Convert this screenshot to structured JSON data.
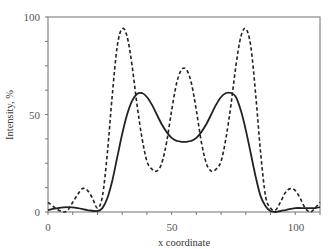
{
  "chart_data": {
    "type": "line",
    "title": "",
    "xlabel": "x coordinate",
    "ylabel": "Intensity, %",
    "xlim": [
      0,
      110
    ],
    "ylim": [
      0,
      100
    ],
    "x_ticks": [
      0,
      50,
      100
    ],
    "y_ticks": [
      0,
      50,
      100
    ],
    "x_minor_step": 10,
    "y_minor_step": 12.5,
    "grid": false,
    "legend": null,
    "series": [
      {
        "name": "dashed",
        "style": "dashed",
        "x": [
          0,
          3,
          6,
          8,
          10,
          12,
          14,
          16,
          18,
          20,
          22,
          24,
          26,
          28,
          30,
          32,
          34,
          36,
          38,
          40,
          42,
          44,
          46,
          48,
          50,
          52,
          54,
          56,
          58,
          60,
          62,
          64,
          66,
          68,
          70,
          72,
          74,
          76,
          78,
          80,
          82,
          84,
          86,
          88,
          90,
          92,
          94,
          96,
          98,
          100,
          102,
          104,
          106,
          108,
          110
        ],
        "y": [
          5,
          2,
          0,
          1,
          5,
          9,
          12,
          11,
          7,
          2,
          8,
          30,
          60,
          85,
          94,
          90,
          75,
          55,
          38,
          26,
          22,
          21,
          25,
          36,
          52,
          66,
          73,
          73,
          66,
          52,
          36,
          25,
          21,
          22,
          26,
          38,
          55,
          75,
          90,
          94,
          85,
          60,
          30,
          8,
          2,
          1,
          5,
          10,
          12,
          11,
          7,
          2,
          0,
          2,
          5
        ]
      },
      {
        "name": "solid",
        "style": "solid",
        "x": [
          0,
          4,
          8,
          12,
          16,
          20,
          22,
          24,
          26,
          28,
          30,
          32,
          34,
          36,
          38,
          40,
          42,
          44,
          46,
          48,
          50,
          52,
          54,
          56,
          58,
          60,
          62,
          64,
          66,
          68,
          70,
          72,
          74,
          76,
          78,
          80,
          82,
          84,
          86,
          88,
          90,
          92,
          94,
          96,
          100,
          104,
          108,
          110
        ],
        "y": [
          1,
          2,
          2.5,
          2,
          1,
          0.5,
          2,
          7,
          16,
          28,
          40,
          50,
          57,
          60.5,
          61,
          59,
          55,
          50,
          45,
          41,
          38,
          36.5,
          36,
          36,
          36.5,
          38,
          41,
          45,
          50,
          55,
          59,
          61,
          61,
          59,
          52,
          42,
          30,
          18,
          8,
          3,
          0.5,
          0,
          0.5,
          1,
          2,
          2,
          2,
          2.5
        ]
      }
    ]
  },
  "axes": {
    "y_tick_labels": [
      "100",
      "50",
      "0"
    ],
    "x_tick_labels": [
      "0",
      "50",
      "100"
    ],
    "xlabel": "x coordinate",
    "ylabel": "Intensity, %"
  }
}
